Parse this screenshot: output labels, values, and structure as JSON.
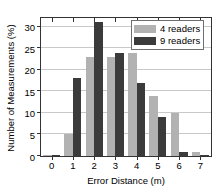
{
  "chart_data": {
    "type": "bar",
    "title": "",
    "xlabel": "Error Distance (m)",
    "ylabel": "Number of Measurements (%)",
    "categories": [
      "0",
      "1",
      "2",
      "3",
      "4",
      "5",
      "6",
      "7"
    ],
    "series": [
      {
        "name": "4 readers",
        "color": "#b2b2b2",
        "values": [
          0.3,
          5,
          23,
          23,
          24,
          14,
          10,
          1
        ]
      },
      {
        "name": "9 readers",
        "color": "#3b3b3b",
        "values": [
          0.3,
          18,
          31,
          24,
          17,
          9,
          1,
          0.3
        ]
      }
    ],
    "ylim": [
      0,
      32
    ],
    "yticks": [
      0,
      5,
      10,
      15,
      20,
      25,
      30
    ],
    "ytick_labels": [
      "0",
      "5",
      "10",
      "15",
      "20",
      "25",
      "30"
    ],
    "xtick_labels": [
      "0",
      "1",
      "2",
      "3",
      "4",
      "5",
      "6",
      "7"
    ],
    "grid": true,
    "legend_position": "top-right",
    "legend_entries": [
      "4 readers",
      "9 readers"
    ]
  },
  "colors": {
    "series_light": "#b2b2b2",
    "series_dark": "#3b3b3b",
    "axis": "#333333",
    "grid": "#c9c9c9",
    "background": "#ffffff",
    "text": "#000000"
  }
}
